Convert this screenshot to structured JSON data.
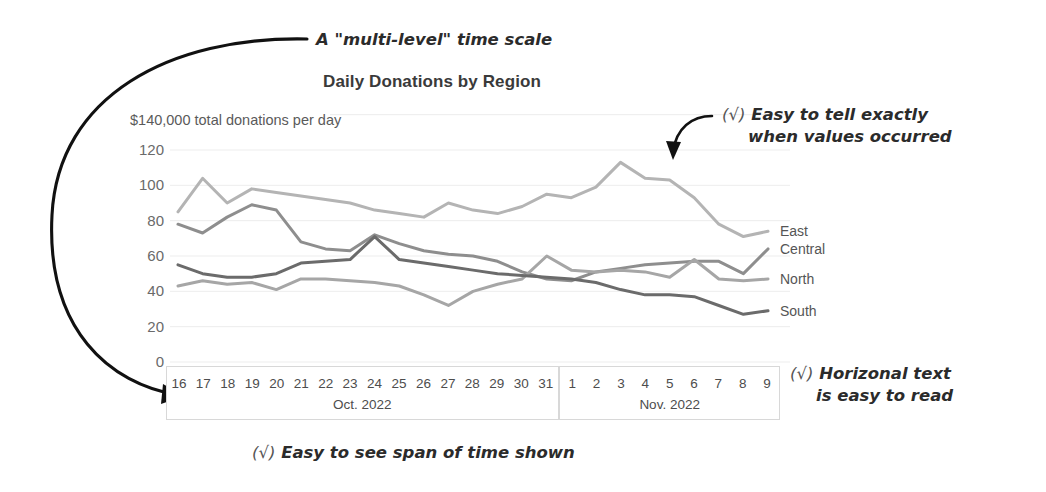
{
  "chart_data": {
    "type": "line",
    "title": "Daily Donations by Region",
    "subtitle": "$140,000 total donations per day",
    "xlabel": "",
    "ylabel": "",
    "ylim": [
      0,
      140
    ],
    "yticks": [
      0,
      20,
      40,
      60,
      80,
      100,
      120
    ],
    "grid": true,
    "legend_position": "right-inline",
    "x_axis_style": "multi-level",
    "x_levels": [
      {
        "label": "Oct. 2022",
        "ticks": [
          "16",
          "17",
          "18",
          "19",
          "20",
          "21",
          "22",
          "23",
          "24",
          "25",
          "26",
          "27",
          "28",
          "29",
          "30",
          "31"
        ]
      },
      {
        "label": "Nov. 2022",
        "ticks": [
          "1",
          "2",
          "3",
          "4",
          "5",
          "6",
          "7",
          "8",
          "9"
        ]
      }
    ],
    "x": [
      "Oct 16",
      "Oct 17",
      "Oct 18",
      "Oct 19",
      "Oct 20",
      "Oct 21",
      "Oct 22",
      "Oct 23",
      "Oct 24",
      "Oct 25",
      "Oct 26",
      "Oct 27",
      "Oct 28",
      "Oct 29",
      "Oct 30",
      "Oct 31",
      "Nov 1",
      "Nov 2",
      "Nov 3",
      "Nov 4",
      "Nov 5",
      "Nov 6",
      "Nov 7",
      "Nov 8",
      "Nov 9"
    ],
    "series": [
      {
        "name": "East",
        "color": "#b4b4b4",
        "values": [
          85,
          104,
          90,
          98,
          96,
          94,
          92,
          90,
          86,
          84,
          82,
          90,
          86,
          84,
          88,
          95,
          93,
          99,
          113,
          104,
          103,
          93,
          78,
          71,
          74
        ]
      },
      {
        "name": "Central",
        "color": "#8e8e8e",
        "values": [
          78,
          73,
          82,
          89,
          86,
          68,
          64,
          63,
          72,
          67,
          63,
          61,
          60,
          57,
          51,
          47,
          46,
          51,
          53,
          55,
          56,
          57,
          57,
          50,
          64
        ]
      },
      {
        "name": "North",
        "color": "#a6a6a6",
        "values": [
          43,
          46,
          44,
          45,
          41,
          47,
          47,
          46,
          45,
          43,
          38,
          32,
          40,
          44,
          47,
          60,
          52,
          51,
          52,
          51,
          48,
          58,
          47,
          46,
          47
        ]
      },
      {
        "name": "South",
        "color": "#6b6b6b",
        "values": [
          55,
          50,
          48,
          48,
          50,
          56,
          57,
          58,
          71,
          58,
          56,
          54,
          52,
          50,
          49,
          48,
          47,
          45,
          41,
          38,
          38,
          37,
          32,
          27,
          29
        ]
      }
    ]
  },
  "annotations": {
    "multi_level": "A \"multi-level\" time scale",
    "exactly_line1": "Easy to tell exactly",
    "exactly_line2": "when values occurred",
    "horizontal_line1": "Horizonal text",
    "horizontal_line2": "is easy to read",
    "span_of_time": "Easy to see span of time shown",
    "check_mark": "(√)"
  }
}
